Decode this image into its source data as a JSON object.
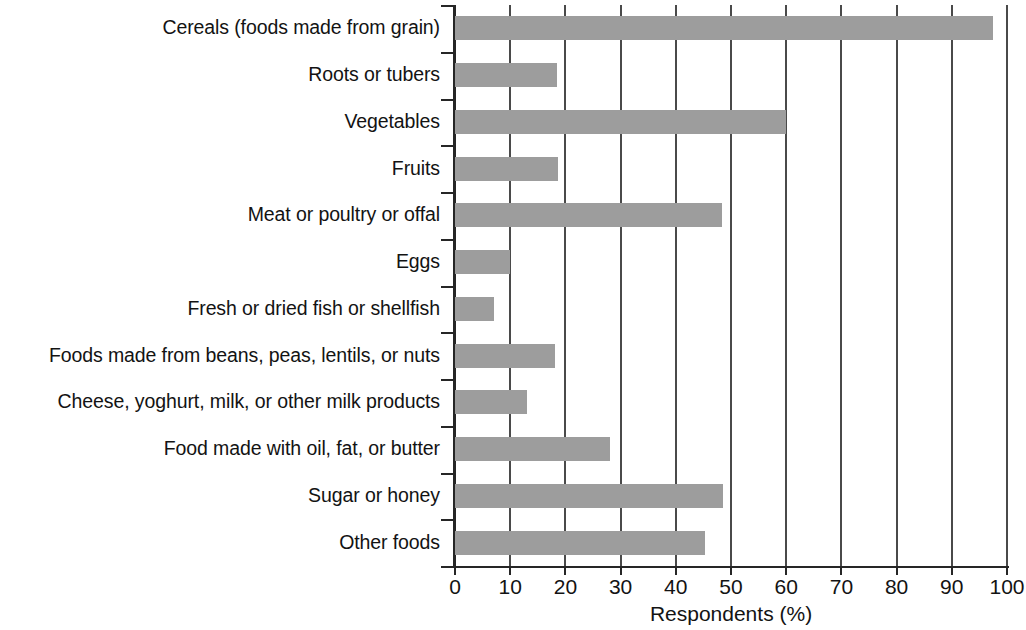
{
  "chart_data": {
    "type": "bar",
    "orientation": "horizontal",
    "title": "",
    "xlabel": "Respondents (%)",
    "ylabel": "",
    "xlim": [
      0,
      100
    ],
    "xticks": [
      0,
      10,
      20,
      30,
      40,
      50,
      60,
      70,
      80,
      90,
      100
    ],
    "xtick_labels": [
      "0",
      "10",
      "20",
      "30",
      "40",
      "50",
      "60",
      "70",
      "80",
      "90",
      "100"
    ],
    "grid": true,
    "legend": null,
    "bar_color": "#9d9d9d",
    "axis_color": "#262626",
    "categories": [
      "Cereals (foods made from grain)",
      "Roots or tubers",
      "Vegetables",
      "Fruits",
      "Meat or poultry or offal",
      "Eggs",
      "Fresh or dried fish or shellfish",
      "Foods made from beans, peas, lentils, or nuts",
      "Cheese, yoghurt, milk, or other milk products",
      "Food made with oil, fat, or butter",
      "Sugar or honey",
      "Other foods"
    ],
    "values": [
      97.5,
      18.5,
      60,
      18.7,
      48.4,
      10,
      7,
      18.2,
      13,
      28,
      48.6,
      45.3
    ]
  }
}
